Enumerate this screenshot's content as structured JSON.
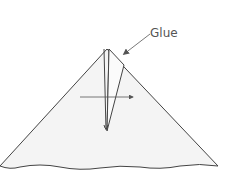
{
  "diagram": {
    "labels": {
      "glue": "Glue"
    },
    "colors": {
      "paper_fill": "#f4f4f4",
      "outline": "#444444",
      "arrow": "#555555",
      "label_text": "#555555"
    }
  }
}
